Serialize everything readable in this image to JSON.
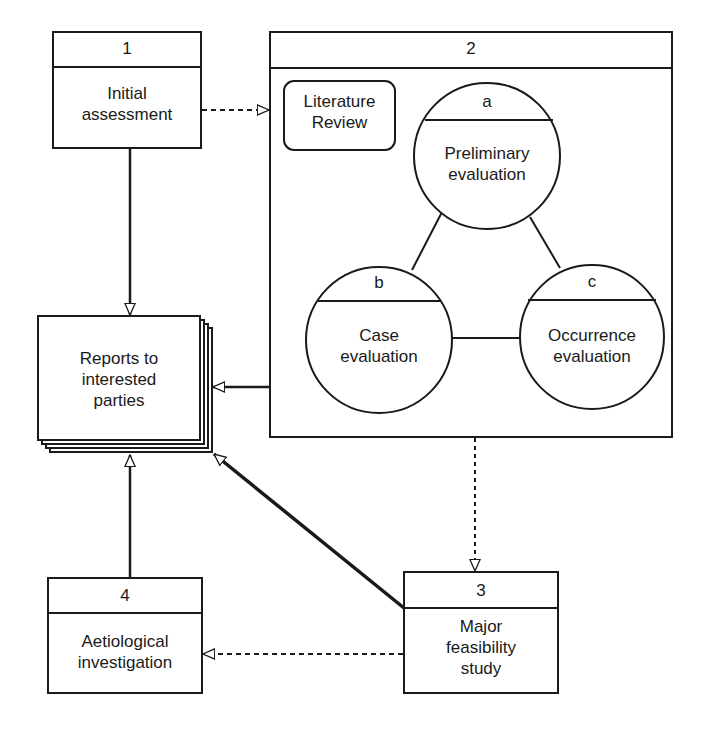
{
  "diagram": {
    "nodes": {
      "n1": {
        "number": "1",
        "label_line1": "Initial",
        "label_line2": "assessment"
      },
      "n2": {
        "number": "2",
        "literature_line1": "Literature",
        "literature_line2": "Review",
        "a": {
          "letter": "a",
          "line1": "Preliminary",
          "line2": "evaluation"
        },
        "b": {
          "letter": "b",
          "line1": "Case",
          "line2": "evaluation"
        },
        "c": {
          "letter": "c",
          "line1": "Occurrence",
          "line2": "evaluation"
        }
      },
      "reports": {
        "line1": "Reports to",
        "line2": "interested",
        "line3": "parties"
      },
      "n3": {
        "number": "3",
        "line1": "Major",
        "line2": "feasibility",
        "line3": "study"
      },
      "n4": {
        "number": "4",
        "line1": "Aetiological",
        "line2": "investigation"
      }
    },
    "edges": [
      {
        "from": "1",
        "to": "2",
        "style": "dashed"
      },
      {
        "from": "1",
        "to": "reports",
        "style": "solid"
      },
      {
        "from": "2",
        "to": "reports",
        "style": "solid"
      },
      {
        "from": "2",
        "to": "3",
        "style": "dashed"
      },
      {
        "from": "3",
        "to": "reports",
        "style": "solid-thick"
      },
      {
        "from": "3",
        "to": "4",
        "style": "dashed"
      },
      {
        "from": "4",
        "to": "reports",
        "style": "solid"
      },
      {
        "from": "a",
        "to": "b",
        "style": "line"
      },
      {
        "from": "a",
        "to": "c",
        "style": "line"
      },
      {
        "from": "b",
        "to": "c",
        "style": "line"
      }
    ],
    "colors": {
      "stroke": "#1a1a1a",
      "background": "#ffffff"
    }
  }
}
